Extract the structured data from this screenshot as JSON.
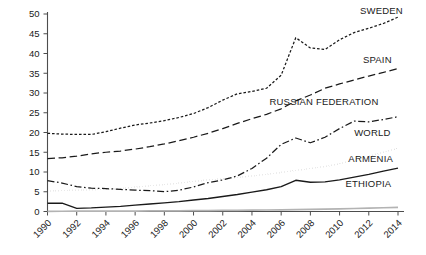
{
  "chart_data": {
    "type": "line",
    "title": "",
    "subtitle": "",
    "xlabel": "",
    "ylabel": "",
    "xlim": [
      1990,
      2014
    ],
    "ylim": [
      0,
      50
    ],
    "grid": false,
    "legend_position": "inline-right",
    "x": [
      1990,
      1991,
      1992,
      1993,
      1994,
      1995,
      1996,
      1997,
      1998,
      1999,
      2000,
      2001,
      2002,
      2003,
      2004,
      2005,
      2006,
      2007,
      2008,
      2009,
      2010,
      2011,
      2012,
      2013,
      2014
    ],
    "xticks": [
      "1990",
      "1992",
      "1994",
      "1996",
      "1998",
      "2000",
      "2002",
      "2004",
      "2006",
      "2008",
      "2010",
      "2012",
      "2014"
    ],
    "xtick_values": [
      1990,
      1992,
      1994,
      1996,
      1998,
      2000,
      2002,
      2004,
      2006,
      2008,
      2010,
      2012,
      2014
    ],
    "yticks": [
      "0",
      "5",
      "10",
      "15",
      "20",
      "25",
      "30",
      "35",
      "40",
      "45",
      "50"
    ],
    "ytick_values": [
      0,
      5,
      10,
      15,
      20,
      25,
      30,
      35,
      40,
      45,
      50
    ],
    "series": [
      {
        "name": "SWEDEN",
        "label": "SWEDEN",
        "style": "fine-dashed",
        "color": "#1a1a1a",
        "label_x": 2011.4,
        "label_y": 50.0,
        "values": [
          19.8,
          19.6,
          19.5,
          19.5,
          20.2,
          21.1,
          21.9,
          22.4,
          23.0,
          23.8,
          24.8,
          26.3,
          28.2,
          29.8,
          30.4,
          31.2,
          34.5,
          44.0,
          41.4,
          41.0,
          43.5,
          45.3,
          46.4,
          47.6,
          49.2
        ]
      },
      {
        "name": "SPAIN",
        "label": "SPAIN",
        "style": "long-dashed",
        "color": "#1a1a1a",
        "label_x": 2011.6,
        "label_y": 37.5,
        "values": [
          13.4,
          13.6,
          14.0,
          14.6,
          15.0,
          15.3,
          15.8,
          16.4,
          17.1,
          17.9,
          18.8,
          19.8,
          21.0,
          22.3,
          23.5,
          24.6,
          26.0,
          28.0,
          29.5,
          31.2,
          32.3,
          33.3,
          34.3,
          35.2,
          36.2
        ]
      },
      {
        "name": "RUSSIAN FEDERATION",
        "label": "RUSSIAN FEDERATION",
        "style": "dash-dot",
        "color": "#1a1a1a",
        "label_x": 2005.2,
        "label_y": 27.0,
        "values": [
          7.8,
          7.2,
          6.3,
          5.9,
          5.8,
          5.6,
          5.4,
          5.3,
          5.0,
          5.4,
          6.2,
          7.3,
          8.0,
          9.0,
          10.9,
          13.5,
          17.0,
          18.6,
          17.4,
          18.8,
          21.0,
          22.9,
          22.7,
          23.3,
          24.0
        ]
      },
      {
        "name": "WORLD",
        "label": "WORLD",
        "style": "dotted",
        "color": "#1a1a1a",
        "label_x": 2011.0,
        "label_y": 19.0,
        "values": [
          5.2,
          5.3,
          5.4,
          5.5,
          5.6,
          5.8,
          6.2,
          6.5,
          6.8,
          7.2,
          7.6,
          8.0,
          8.3,
          8.6,
          9.0,
          9.4,
          9.9,
          10.4,
          10.9,
          11.4,
          12.1,
          13.0,
          14.0,
          15.0,
          16.0
        ]
      },
      {
        "name": "ARMENIA",
        "label": "ARMENIA",
        "style": "solid",
        "color": "#1a1a1a",
        "label_x": 2010.6,
        "label_y": 12.5,
        "values": [
          2.1,
          2.1,
          0.8,
          0.9,
          1.1,
          1.3,
          1.6,
          1.9,
          2.2,
          2.5,
          2.9,
          3.3,
          3.8,
          4.3,
          4.9,
          5.5,
          6.3,
          7.9,
          7.4,
          7.5,
          8.0,
          8.7,
          9.4,
          10.2,
          11.0
        ]
      },
      {
        "name": "ETHIOPIA",
        "label": "ETHIOPIA",
        "style": "solid-gray",
        "color": "#b3b3b3",
        "label_x": 2010.4,
        "label_y": 6.2,
        "values": [
          0.05,
          0.06,
          0.07,
          0.08,
          0.09,
          0.1,
          0.12,
          0.14,
          0.16,
          0.18,
          0.2,
          0.23,
          0.26,
          0.3,
          0.34,
          0.38,
          0.43,
          0.48,
          0.54,
          0.6,
          0.68,
          0.76,
          0.85,
          0.95,
          1.05
        ]
      }
    ]
  }
}
